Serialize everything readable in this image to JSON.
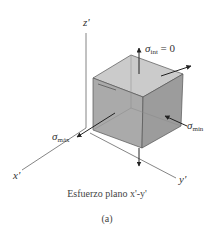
{
  "figure": {
    "axes": {
      "z_label": "z'",
      "x_label": "x'",
      "y_label": "y'"
    },
    "stresses": {
      "int": {
        "symbol": "σ",
        "subscript": "int",
        "suffix": " = 0"
      },
      "max": {
        "symbol": "σ",
        "subscript": "máx"
      },
      "min": {
        "symbol": "σ",
        "subscript": "mín"
      }
    },
    "caption": "Esfuerzo plano x'-y'",
    "sublabel": "(a)",
    "colors": {
      "cube_top": "#c8c8c8",
      "cube_front": "#a9a9a9",
      "cube_right": "#9a9a9a",
      "edge": "#555555",
      "axis": "#555555",
      "arrow": "#222222"
    }
  }
}
